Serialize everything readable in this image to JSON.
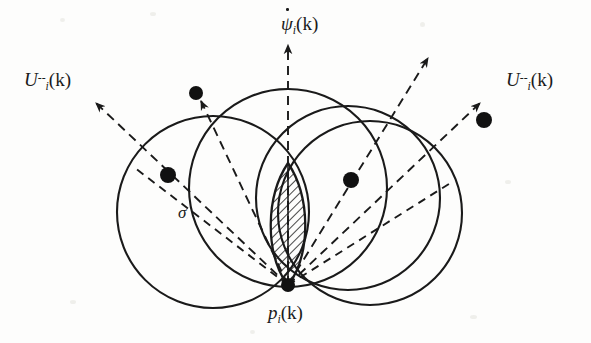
{
  "figure": {
    "background_color": "#fdfdfc",
    "stroke_color": "#1a1a1a",
    "width": 591,
    "height": 343
  },
  "labels": {
    "u_left": {
      "base": "U",
      "sub": "i",
      "sup": "--",
      "arg": "(k)",
      "x": 24,
      "y": 70
    },
    "u_right": {
      "base": "U",
      "sub": "i",
      "sup": "--",
      "arg": "(k)",
      "x": 506,
      "y": 70
    },
    "psi": {
      "base": "ψ",
      "sub": "i",
      "arg": "(k)",
      "accent": "dot",
      "x": 281,
      "y": 14
    },
    "p": {
      "base": "p",
      "sub": "i",
      "arg": "(k)",
      "x": 268,
      "y": 303
    },
    "sigma": {
      "base": "σ",
      "x": 178,
      "y": 204
    }
  },
  "geometry": {
    "origin_point": {
      "name": "p_i(k)",
      "x": 288,
      "y": 285,
      "radius": 7
    },
    "circles": [
      {
        "name": "circle-left",
        "cx": 213,
        "cy": 212,
        "r": 96
      },
      {
        "name": "circle-center-left",
        "cx": 288,
        "cy": 188,
        "r": 99
      },
      {
        "name": "circle-center-right",
        "cx": 348,
        "cy": 198,
        "r": 92
      },
      {
        "name": "circle-right",
        "cx": 370,
        "cy": 213,
        "r": 92
      }
    ],
    "lens": {
      "name": "hatched-intersection",
      "apex_top": {
        "x": 288,
        "y": 163
      },
      "apex_bottom": {
        "x": 288,
        "y": 286
      },
      "half_width": 22,
      "hatch_angle_deg": 45,
      "hatch_spacing": 6
    },
    "dashed_rays": [
      {
        "name": "ray-u-left",
        "x1": 288,
        "y1": 285,
        "x2": 96,
        "y2": 103,
        "arrow": true
      },
      {
        "name": "ray-psi-up",
        "x1": 288,
        "y1": 285,
        "x2": 288,
        "y2": 45,
        "arrow": true
      },
      {
        "name": "ray-u-right",
        "x1": 288,
        "y1": 285,
        "x2": 480,
        "y2": 103,
        "arrow": true
      },
      {
        "name": "ray-inner-left",
        "x1": 288,
        "y1": 285,
        "x2": 200,
        "y2": 100,
        "arrow": true
      },
      {
        "name": "ray-inner-right",
        "x1": 288,
        "y1": 285,
        "x2": 428,
        "y2": 58,
        "arrow": true
      },
      {
        "name": "ray-chord-left",
        "x1": 288,
        "y1": 285,
        "x2": 135,
        "y2": 168,
        "arrow": false
      },
      {
        "name": "ray-chord-right",
        "x1": 288,
        "y1": 285,
        "x2": 452,
        "y2": 182,
        "arrow": false
      }
    ],
    "agent_dots": [
      {
        "name": "agent-dot-upper-left",
        "cx": 196,
        "cy": 93,
        "r": 7
      },
      {
        "name": "agent-dot-left",
        "cx": 168,
        "cy": 175,
        "r": 8
      },
      {
        "name": "agent-dot-right",
        "cx": 351,
        "cy": 180,
        "r": 8
      },
      {
        "name": "agent-dot-upper-right",
        "cx": 484,
        "cy": 120,
        "r": 8
      }
    ]
  }
}
